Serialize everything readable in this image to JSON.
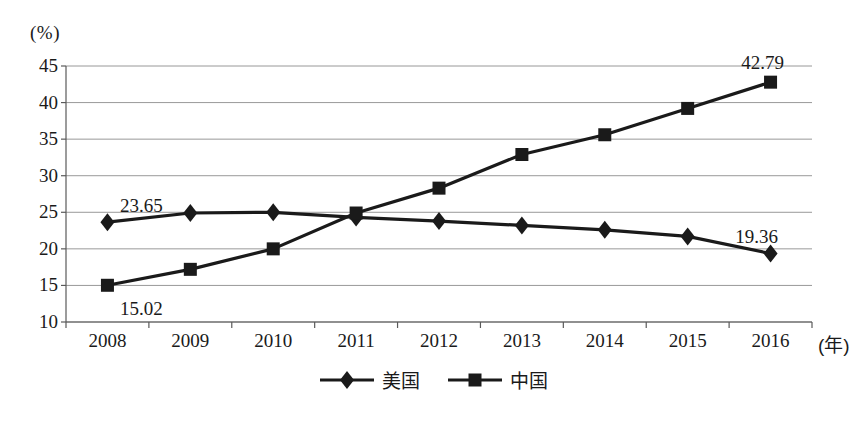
{
  "chart_data": {
    "type": "line",
    "title": "",
    "xlabel": "年",
    "ylabel": "(%)",
    "ylim": [
      10,
      45
    ],
    "yticks": [
      10,
      15,
      20,
      25,
      30,
      35,
      40,
      45
    ],
    "ytick_labels": [
      "10",
      "15",
      "20",
      "25",
      "30",
      "35",
      "40",
      "45"
    ],
    "grid": true,
    "legend_position": "bottom",
    "categories": [
      "2008",
      "2009",
      "2010",
      "2011",
      "2012",
      "2013",
      "2014",
      "2015",
      "2016"
    ],
    "series": [
      {
        "name": "美国",
        "marker": "diamond",
        "color": "#1a1a1a",
        "values": [
          23.65,
          24.9,
          25.0,
          24.3,
          23.8,
          23.2,
          22.6,
          21.7,
          19.36
        ]
      },
      {
        "name": "中国",
        "marker": "square",
        "color": "#1a1a1a",
        "values": [
          15.02,
          17.2,
          20.0,
          24.9,
          28.3,
          32.9,
          35.6,
          39.2,
          42.79
        ]
      }
    ],
    "annotations": [
      {
        "text": "23.65",
        "series": "美国",
        "category": "2008",
        "value": 23.65,
        "position": "above"
      },
      {
        "text": "15.02",
        "series": "中国",
        "category": "2008",
        "value": 15.02,
        "position": "below"
      },
      {
        "text": "42.79",
        "series": "中国",
        "category": "2016",
        "value": 42.79,
        "position": "above"
      },
      {
        "text": "19.36",
        "series": "美国",
        "category": "2016",
        "value": 19.36,
        "position": "above"
      }
    ]
  },
  "axis": {
    "y_unit_label": "(%)",
    "x_unit_label": "(年)"
  },
  "legend": {
    "entries": [
      {
        "label": "美国",
        "marker": "diamond"
      },
      {
        "label": "中国",
        "marker": "square"
      }
    ]
  },
  "style": {
    "line_color": "#1a1a1a",
    "grid_color": "#8d8d8d",
    "axis_color": "#5a5a5a",
    "background": "#ffffff"
  }
}
